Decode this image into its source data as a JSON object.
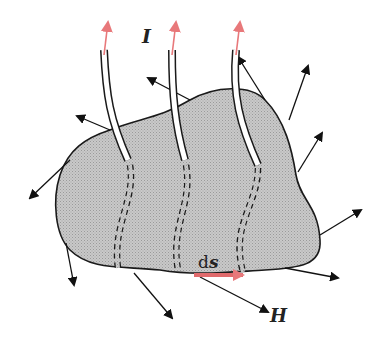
{
  "diagram": {
    "labels": {
      "current": "I",
      "field": "H",
      "element_d": "d",
      "element_s": "s"
    },
    "colors": {
      "surface_fill": "#c4c4c4",
      "outline": "#1a1a1a",
      "current_arrow": "#e8787a",
      "ds_arrow": "#e06a6c",
      "field_arrow": "#111111"
    },
    "wires_count": 3,
    "field_arrows_count": 11
  }
}
